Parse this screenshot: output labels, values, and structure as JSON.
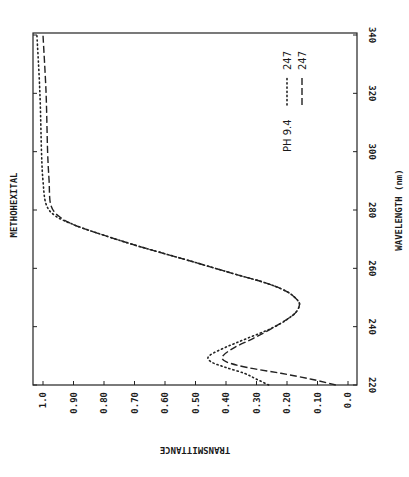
{
  "chart_data": {
    "type": "line",
    "orientation": "rotated-90-clockwise",
    "title": "METHOHEXITAL",
    "xlabel": "WAVELENGTH (nm)",
    "ylabel": "TRANSMITTANCE",
    "xlim": [
      220,
      340
    ],
    "ylim": [
      0.0,
      1.0
    ],
    "x_ticks": [
      "220",
      "240",
      "260",
      "280",
      "300",
      "320",
      "340"
    ],
    "y_ticks": [
      "1.0",
      "0.90",
      "0.80",
      "0.70",
      "0.60",
      "0.50",
      "0.40",
      "0.30",
      "0.20",
      "0.10",
      "0.0"
    ],
    "grid": false,
    "legend": {
      "header": "PH 9.4",
      "position": "upper-right (rotated)",
      "entries": [
        {
          "label": "247",
          "style": "dotted"
        },
        {
          "label": "247",
          "style": "dashed"
        }
      ]
    },
    "series": [
      {
        "name": "247 (dotted)",
        "style": "dotted",
        "x": [
          220,
          222,
          224,
          226,
          228,
          230,
          233,
          236,
          240,
          244,
          247,
          249,
          252,
          255,
          258,
          262,
          265,
          268,
          272,
          275,
          278,
          282,
          290,
          300,
          320,
          340
        ],
        "values": [
          0.26,
          0.3,
          0.34,
          0.4,
          0.45,
          0.455,
          0.4,
          0.33,
          0.24,
          0.18,
          0.16,
          0.165,
          0.2,
          0.27,
          0.37,
          0.5,
          0.6,
          0.7,
          0.82,
          0.9,
          0.96,
          0.99,
          1.0,
          1.005,
          1.01,
          1.02
        ]
      },
      {
        "name": "247 (dashed)",
        "style": "dashed",
        "x": [
          220,
          222,
          224,
          226,
          228,
          230,
          233,
          236,
          240,
          244,
          247,
          249,
          252,
          255,
          258,
          262,
          265,
          268,
          272,
          275,
          278,
          282,
          290,
          300,
          320,
          340
        ],
        "values": [
          0.04,
          0.12,
          0.22,
          0.33,
          0.4,
          0.41,
          0.37,
          0.31,
          0.24,
          0.18,
          0.16,
          0.165,
          0.2,
          0.27,
          0.37,
          0.5,
          0.6,
          0.7,
          0.82,
          0.9,
          0.95,
          0.975,
          0.98,
          0.985,
          0.99,
          1.0
        ]
      }
    ]
  }
}
